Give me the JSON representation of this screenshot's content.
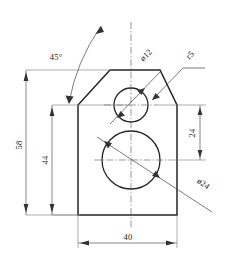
{
  "drawing": {
    "title": "Orthographic part drawing with two holes",
    "units": "mm",
    "line_color": "#262626",
    "dim_color": "#555555",
    "background": "#ffffff"
  },
  "dimensions": {
    "height_overall": "58",
    "height_body": "44",
    "height_hole_spacing": "24",
    "width_overall": "40",
    "chamfer_angle": "45°",
    "small_hole": "ø12",
    "large_hole": "ø24",
    "fillet": "r5"
  },
  "labels": [
    {
      "name": "angle-45",
      "text": "45°"
    },
    {
      "name": "small-hole-diameter",
      "text": "ø12"
    },
    {
      "name": "fillet-radius",
      "text": "r5"
    },
    {
      "name": "large-hole-diameter",
      "text": "ø24"
    },
    {
      "name": "overall-height",
      "text": "58"
    },
    {
      "name": "body-height",
      "text": "44"
    },
    {
      "name": "hole-spacing",
      "text": "24"
    },
    {
      "name": "overall-width",
      "text": "40"
    }
  ],
  "geometry": {
    "outline_note": "pentagon: rectangle with chamfered top corners meeting a flat apex",
    "bottom_y": "215",
    "shoulder_y": "105",
    "apex_y": "70",
    "left_x": "78",
    "right_x": "177"
  }
}
